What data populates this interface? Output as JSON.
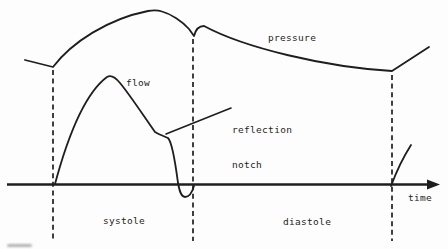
{
  "figure": {
    "colors": {
      "ink": "#1e1e1e",
      "background": "#fdfdfd"
    },
    "labels": {
      "pressure": "pressure",
      "flow": "flow",
      "reflection_line1": "reflection",
      "reflection_line2": "notch",
      "time": "time",
      "systole": "systole",
      "diastole": "diastole"
    },
    "paths": {
      "pressure_curve": "M 25,60 L 53,67 C 72,42 108,19 148,11 C 153,10.2 158,10.2 162,11.5 C 171,14 182,21 189,29 L 194,36 C 195.5,30 199,26 204,26 C 245,48 325,67 392,71 L 429,47",
      "flow_curve": "M 55,184 C 62,158 80,97 107,77 C 111,74.5 116,78 120,83 C 130,95 143,115 155,132 C 160,135 164,136 168,138 C 171,141 175,160 178,183 C 179.5,191 181,197 185,197 C 189,197 192,193 194,186",
      "flow_next_upstroke": "M 391,186 C 397,170 404,156 411,145",
      "leader_line": "M 166,134 L 231,108",
      "axis_line": "M 7,184.5 L 431,184.5",
      "dashed_line_systole_start": "M 53,70 L 53,241",
      "dashed_line_systole_end": "M 193,39 L 193,241",
      "dashed_line_diastole_end": "M 392,75 L 392,241"
    },
    "arrowhead_points": "427,179.5 440,184.5 427,189.5"
  }
}
